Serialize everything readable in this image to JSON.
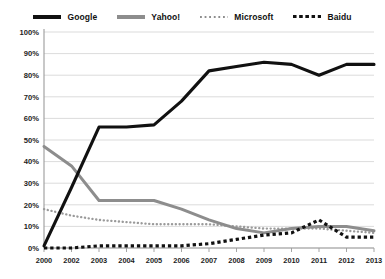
{
  "legend": {
    "position": "top",
    "items": [
      {
        "label": "Google",
        "color": "#111111",
        "style": "solid",
        "icon": "line-solid-icon"
      },
      {
        "label": "Yahoo!",
        "color": "#8d8d8d",
        "style": "solid",
        "icon": "line-solid-icon"
      },
      {
        "label": "Microsoft",
        "color": "#9a9a9a",
        "style": "dotted",
        "icon": "line-dotted-icon"
      },
      {
        "label": "Baidu",
        "color": "#111111",
        "style": "dotted",
        "icon": "line-dotted-icon"
      }
    ]
  },
  "chart_data": {
    "type": "line",
    "title": "",
    "xlabel": "",
    "ylabel": "",
    "categories": [
      "2000",
      "2002",
      "2003",
      "2004",
      "2005",
      "2006",
      "2007",
      "2008",
      "2009",
      "2010",
      "2011",
      "2012",
      "2013"
    ],
    "ylim": [
      0,
      100
    ],
    "ytick_labels": [
      "0%",
      "10%",
      "20%",
      "30%",
      "40%",
      "50%",
      "60%",
      "70%",
      "80%",
      "90%",
      "100%"
    ],
    "ytick_values": [
      0,
      10,
      20,
      30,
      40,
      50,
      60,
      70,
      80,
      90,
      100
    ],
    "grid": true,
    "legend_position": "top",
    "series": [
      {
        "name": "Google",
        "color": "#111111",
        "style": "solid",
        "values": [
          1,
          28,
          56,
          56,
          57,
          68,
          82,
          84,
          86,
          85,
          80,
          85,
          85
        ]
      },
      {
        "name": "Yahoo!",
        "color": "#8d8d8d",
        "style": "solid",
        "values": [
          47,
          38,
          22,
          22,
          22,
          18,
          13,
          9,
          7,
          9,
          10,
          10,
          8
        ]
      },
      {
        "name": "Microsoft",
        "color": "#9a9a9a",
        "style": "dotted",
        "values": [
          18,
          15,
          13,
          12,
          11,
          11,
          11,
          10,
          9,
          9,
          9,
          8,
          7
        ]
      },
      {
        "name": "Baidu",
        "color": "#111111",
        "style": "dotted",
        "values": [
          0,
          0,
          1,
          1,
          1,
          1,
          2,
          4,
          6,
          7,
          13,
          5,
          5
        ]
      }
    ]
  }
}
